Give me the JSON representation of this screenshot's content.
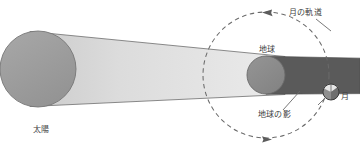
{
  "diagram": {
    "title_text": "",
    "canvas": {
      "width": 360,
      "height": 152,
      "background": "#ffffff"
    },
    "labels": {
      "sun": "太陽",
      "earth": "地球",
      "moon": "月",
      "moon_orbit": "月の軌道",
      "earth_shadow": "地球の影"
    },
    "colors": {
      "sun_fill": "#9e9e9e",
      "sun_stroke": "#767676",
      "light_beam_start": "#cfcfcf",
      "light_beam_end": "#e9e9e9",
      "beam_outline": "#6d6d6d",
      "earth_fill": "#8c8c8c",
      "earth_stroke": "#6a6a6a",
      "shadow_fill": "#5a5a5a",
      "moon_light": "#e6e6e6",
      "moon_dark": "#6b6b6b",
      "moon_stroke": "#3a3a3a",
      "orbit_dash": "#6a6a6a",
      "leader_line": "#6a6a6a",
      "text": "#3f3f3f"
    },
    "bodies": {
      "sun": {
        "cx": 38,
        "cy": 69,
        "r": 38
      },
      "earth": {
        "cx": 266,
        "cy": 75,
        "r": 19
      },
      "moon": {
        "cx": 331,
        "cy": 92,
        "r": 8
      }
    },
    "moon_orbit": {
      "cx": 266,
      "cy": 75,
      "r": 63,
      "style": "dashed",
      "direction": "counterclockwise",
      "arrow_top": "left",
      "arrow_bottom": "right"
    },
    "shadow_cone": {
      "from": "earth",
      "extends_to_edge": true,
      "description": "umbra"
    },
    "light_beam": {
      "from": "sun",
      "to": "earth",
      "converging": true
    },
    "leader_lines": [
      {
        "name": "earth-shadow-leader",
        "from": [
          283,
          110
        ],
        "to": [
          299,
          92
        ]
      },
      {
        "name": "moon-orbit-leader",
        "from": [
          314,
          18
        ],
        "to": [
          330,
          29
        ]
      }
    ]
  }
}
